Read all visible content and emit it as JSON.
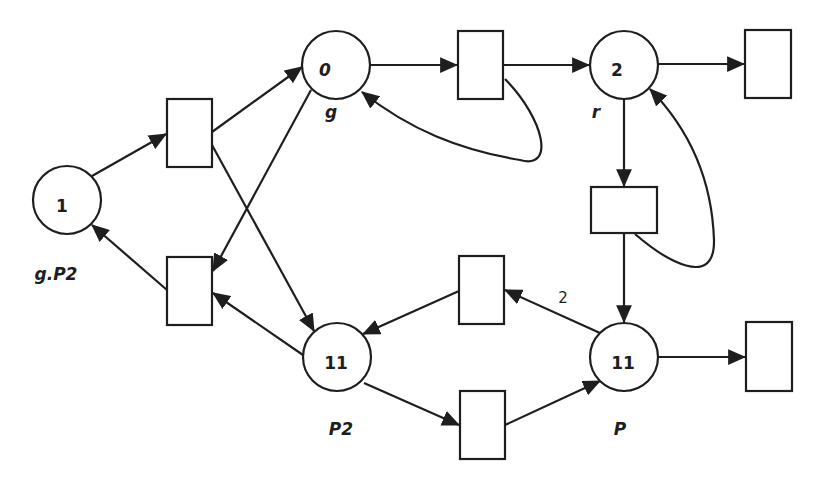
{
  "diagram": {
    "type": "petri-net",
    "places": [
      {
        "id": "p_gP2",
        "tokens": "1",
        "label": "g.P2",
        "cx": 67,
        "cy": 200
      },
      {
        "id": "p_g",
        "tokens": "0",
        "label": "g",
        "cx": 336,
        "cy": 65
      },
      {
        "id": "p_r",
        "tokens": "2",
        "label": "r",
        "cx": 624,
        "cy": 65
      },
      {
        "id": "p_P2",
        "tokens": "11",
        "label": "P2",
        "cx": 337,
        "cy": 357
      },
      {
        "id": "p_P",
        "tokens": "11",
        "label": "P",
        "cx": 624,
        "cy": 357
      }
    ],
    "transitions": [
      {
        "id": "t1",
        "x": 167,
        "y": 99,
        "w": 45,
        "h": 68
      },
      {
        "id": "t2",
        "x": 167,
        "y": 257,
        "w": 45,
        "h": 68
      },
      {
        "id": "t3",
        "x": 458,
        "y": 31,
        "w": 45,
        "h": 68
      },
      {
        "id": "t4",
        "x": 745,
        "y": 30,
        "w": 46,
        "h": 68
      },
      {
        "id": "t5",
        "x": 591,
        "y": 187,
        "w": 66,
        "h": 46
      },
      {
        "id": "t6",
        "x": 459,
        "y": 256,
        "w": 45,
        "h": 68
      },
      {
        "id": "t7",
        "x": 460,
        "y": 391,
        "w": 45,
        "h": 68
      },
      {
        "id": "t8",
        "x": 746,
        "y": 322,
        "w": 46,
        "h": 69
      }
    ],
    "arc_weights": {
      "p_P_to_t6": "2",
      "t7_to_p_P": "2"
    },
    "arcs": [
      {
        "from": "p_gP2",
        "to": "t1"
      },
      {
        "from": "t1",
        "to": "p_g"
      },
      {
        "from": "t1",
        "to": "p_P2"
      },
      {
        "from": "p_g",
        "to": "t3"
      },
      {
        "from": "p_g",
        "to": "t2"
      },
      {
        "from": "t3",
        "to": "p_r"
      },
      {
        "from": "t3",
        "to": "p_g"
      },
      {
        "from": "p_r",
        "to": "t4"
      },
      {
        "from": "p_r",
        "to": "t5"
      },
      {
        "from": "t5",
        "to": "p_r"
      },
      {
        "from": "t5",
        "to": "p_P"
      },
      {
        "from": "p_P",
        "to": "t6",
        "weight": "2"
      },
      {
        "from": "t6",
        "to": "p_P2"
      },
      {
        "from": "p_P2",
        "to": "t2"
      },
      {
        "from": "t2",
        "to": "p_gP2"
      },
      {
        "from": "p_P2",
        "to": "t7"
      },
      {
        "from": "t7",
        "to": "p_P",
        "weight": "2"
      },
      {
        "from": "p_P",
        "to": "t8"
      }
    ],
    "colors": {
      "stroke": "#1e1e1e",
      "fill": "#ffffff"
    }
  }
}
